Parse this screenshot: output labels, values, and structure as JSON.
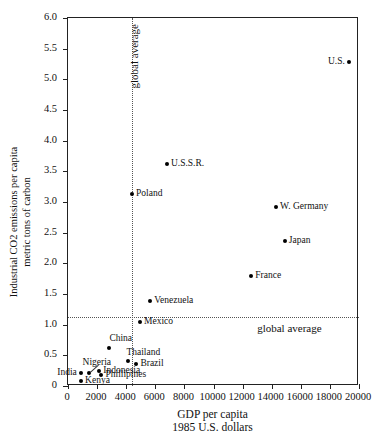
{
  "chart_data": {
    "type": "scatter",
    "title": "",
    "xlabel": "GDP per capita",
    "xlabel_sub": "1985 U.S. dollars",
    "ylabel": "Industrial CO2 emissions per capita",
    "ylabel_sub": "metric tons of carbon",
    "xlim": [
      0,
      20000
    ],
    "ylim": [
      0,
      6.0
    ],
    "grid": false,
    "legend": "none",
    "xticks": [
      0,
      2000,
      4000,
      6000,
      8000,
      10000,
      12000,
      14000,
      16000,
      18000,
      20000
    ],
    "xticklabels": [
      "0",
      "2000",
      "4000",
      "6000",
      "8000",
      "10000",
      "12000",
      "14000",
      "16000",
      "18000",
      "20000"
    ],
    "yticks": [
      0,
      0.5,
      1.0,
      1.5,
      2.0,
      2.5,
      3.0,
      3.5,
      4.0,
      4.5,
      5.0,
      5.5,
      6.0
    ],
    "yticklabels": [
      "0",
      "0.5",
      "1.0",
      "1.5",
      "2.0",
      "2.5",
      "3.0",
      "3.5",
      "4.0",
      "4.5",
      "5.0",
      "5.5",
      "6.0"
    ],
    "annotations": [
      {
        "text": "global average",
        "kind": "vertical-reference-label",
        "x": 4400,
        "orientation": "vertical"
      },
      {
        "text": "global average",
        "kind": "horizontal-reference-label",
        "y": 1.13,
        "orientation": "horizontal"
      }
    ],
    "reference_lines": [
      {
        "name": "global-average-gdp",
        "orientation": "vertical",
        "value": 4400,
        "style": "dotted"
      },
      {
        "name": "global-average-co2",
        "orientation": "horizontal",
        "value": 1.13,
        "style": "dotted"
      }
    ],
    "points": [
      {
        "label": "U.S.",
        "x": 19300,
        "y": 5.28,
        "label_side": "left"
      },
      {
        "label": "U.S.S.R.",
        "x": 6800,
        "y": 3.62,
        "label_side": "right"
      },
      {
        "label": "Poland",
        "x": 4400,
        "y": 3.13,
        "label_side": "right"
      },
      {
        "label": "W. Germany",
        "x": 14300,
        "y": 2.92,
        "label_side": "right"
      },
      {
        "label": "Japan",
        "x": 14900,
        "y": 2.36,
        "label_side": "right"
      },
      {
        "label": "France",
        "x": 12600,
        "y": 1.79,
        "label_side": "right"
      },
      {
        "label": "Venezuela",
        "x": 5650,
        "y": 1.38,
        "label_side": "right"
      },
      {
        "label": "Mexico",
        "x": 4950,
        "y": 1.04,
        "label_side": "right"
      },
      {
        "label": "China",
        "x": 2800,
        "y": 0.62,
        "label_side": "top"
      },
      {
        "label": "Thailand",
        "x": 4150,
        "y": 0.41,
        "label_side": "top-right"
      },
      {
        "label": "Brazil",
        "x": 4700,
        "y": 0.36,
        "label_side": "right"
      },
      {
        "label": "Nigeria",
        "x": 1450,
        "y": 0.21,
        "label_side": "leader"
      },
      {
        "label": "Indonesia",
        "x": 2150,
        "y": 0.25,
        "label_side": "right"
      },
      {
        "label": "Phillipines",
        "x": 2300,
        "y": 0.18,
        "label_side": "right"
      },
      {
        "label": "India",
        "x": 880,
        "y": 0.22,
        "label_side": "left"
      },
      {
        "label": "Kenya",
        "x": 900,
        "y": 0.08,
        "label_side": "right"
      }
    ]
  }
}
